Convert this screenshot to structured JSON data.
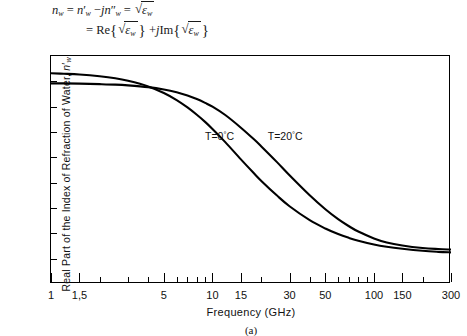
{
  "equation": {
    "line1": {
      "lhs": "n",
      "lhs_sub": "w",
      "eq1": "=",
      "t1": "n",
      "t1_prime": "′",
      "t1_sub": "w",
      "minus": "−",
      "j1": "j",
      "t2": "n",
      "t2_prime": "″",
      "t2_sub": "w",
      "eq2": "=",
      "rad_sym": "ε",
      "rad_sub": "w"
    },
    "line2": {
      "eq": "=",
      "re": "Re",
      "lbrace": "{",
      "rbrace": "}",
      "eps": "ε",
      "eps_sub": "w",
      "plus": "+",
      "j": "j",
      "im": "Im"
    },
    "plain_text_line1": "n_w = n'_w − jn''_w = √ε_w",
    "plain_text_line2": "= Re{√ε_w} + j Im{√ε_w}"
  },
  "chart_data": {
    "type": "line",
    "title": "",
    "caption": "(a)",
    "xlabel": "Frequency (GHz)",
    "ylabel": "Real Part of the Index of Refraction of Water, n′w",
    "ylabel_main": "Real Part of the Index of Refraction of Water, ",
    "ylabel_symbol": "n",
    "ylabel_prime": "′",
    "ylabel_sub": "w",
    "xscale": "log",
    "yscale": "linear",
    "xlim": [
      1,
      300
    ],
    "ylim": [
      1,
      10
    ],
    "grid": false,
    "legend_position": "inline-annotations",
    "xticks": [
      1,
      1.5,
      5,
      10,
      15,
      30,
      50,
      100,
      150,
      300
    ],
    "xtick_labels": [
      "1",
      "1,5",
      "5",
      "10",
      "15",
      "30",
      "50",
      "100",
      "150",
      "300"
    ],
    "xminor_ticks": [
      2,
      3,
      4,
      6,
      7,
      8,
      9,
      20,
      40,
      60,
      70,
      80,
      90,
      200
    ],
    "yticks": [
      1,
      2,
      3,
      4,
      5,
      6,
      7,
      8,
      9,
      10
    ],
    "ytick_labels": [
      "1",
      "2",
      "3",
      "4",
      "5",
      "6",
      "7",
      "8",
      "9",
      "10"
    ],
    "series": [
      {
        "name": "T=0°C",
        "label_prefix": "T=0",
        "label_degree": "°",
        "label_suffix": "C",
        "label_x_ghz": 9.0,
        "label_y": 6.85,
        "color": "#000000",
        "x": [
          1,
          1.2,
          1.5,
          2,
          2.5,
          3,
          4,
          5,
          6,
          7,
          8,
          9,
          10,
          12,
          15,
          18,
          20,
          25,
          30,
          40,
          50,
          60,
          70,
          80,
          100,
          120,
          150,
          200,
          250,
          300
        ],
        "y": [
          9.32,
          9.3,
          9.27,
          9.2,
          9.12,
          9.02,
          8.8,
          8.54,
          8.26,
          7.97,
          7.68,
          7.4,
          7.12,
          6.6,
          5.92,
          5.38,
          5.08,
          4.5,
          4.07,
          3.52,
          3.19,
          2.97,
          2.82,
          2.71,
          2.56,
          2.47,
          2.39,
          2.31,
          2.27,
          2.25
        ]
      },
      {
        "name": "T=20°C",
        "label_prefix": "T=20",
        "label_degree": "°",
        "label_suffix": "C",
        "label_x_ghz": 22.0,
        "label_y": 6.85,
        "color": "#000000",
        "x": [
          1,
          1.2,
          1.5,
          2,
          2.5,
          3,
          4,
          5,
          6,
          7,
          8,
          9,
          10,
          12,
          15,
          18,
          20,
          25,
          30,
          40,
          50,
          60,
          70,
          80,
          100,
          120,
          150,
          200,
          250,
          300
        ],
        "y": [
          8.92,
          8.92,
          8.91,
          8.89,
          8.87,
          8.84,
          8.77,
          8.68,
          8.57,
          8.44,
          8.3,
          8.15,
          8.0,
          7.67,
          7.17,
          6.72,
          6.44,
          5.82,
          5.29,
          4.5,
          3.95,
          3.56,
          3.28,
          3.07,
          2.8,
          2.64,
          2.52,
          2.42,
          2.38,
          2.36
        ]
      }
    ]
  }
}
